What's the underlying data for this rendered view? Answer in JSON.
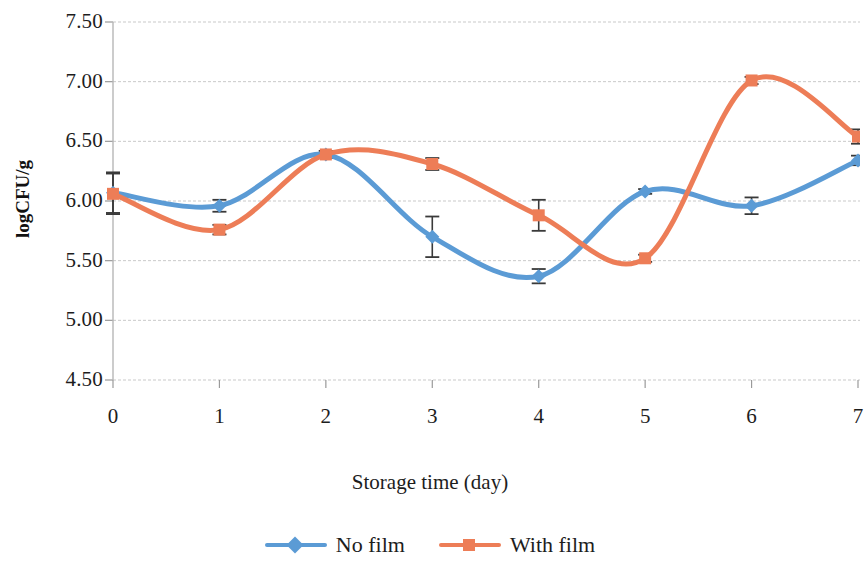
{
  "chart_data": {
    "type": "line",
    "title": "",
    "xlabel": "Storage time (day)",
    "ylabel": "logCFU/g",
    "x": [
      0,
      1,
      2,
      3,
      4,
      5,
      6,
      7
    ],
    "xtick_labels": [
      "0",
      "1",
      "2",
      "3",
      "4",
      "5",
      "6",
      "7"
    ],
    "ytick_labels": [
      "7.50",
      "7.00",
      "6.50",
      "6.00",
      "5.50",
      "5.00",
      "4.50"
    ],
    "ytick_values": [
      7.5,
      7.0,
      6.5,
      6.0,
      5.5,
      5.0,
      4.5
    ],
    "xlim": [
      0,
      7
    ],
    "ylim": [
      4.5,
      7.5
    ],
    "grid": "horizontal",
    "smooth": true,
    "legend_position": "bottom",
    "series": [
      {
        "name": "No film",
        "color": "#5b9bd5",
        "marker": "diamond",
        "values": [
          6.07,
          5.96,
          6.39,
          5.7,
          5.37,
          6.08,
          5.96,
          6.34
        ],
        "errors": [
          0.17,
          0.05,
          0.03,
          0.17,
          0.06,
          0.02,
          0.07,
          0.04
        ]
      },
      {
        "name": "With film",
        "color": "#ed7d57",
        "marker": "square",
        "values": [
          6.06,
          5.76,
          6.39,
          6.31,
          5.88,
          5.52,
          7.01,
          6.54
        ],
        "errors": [
          0.17,
          0.04,
          0.03,
          0.05,
          0.13,
          0.03,
          0.03,
          0.06
        ]
      }
    ]
  },
  "axis": {
    "ylabel": "logCFU/g",
    "xlabel": "Storage time (day)"
  },
  "legend": {
    "items": [
      {
        "label": "No film",
        "color": "#5b9bd5",
        "marker": "diamond"
      },
      {
        "label": "With film",
        "color": "#ed7d57",
        "marker": "square"
      }
    ]
  }
}
